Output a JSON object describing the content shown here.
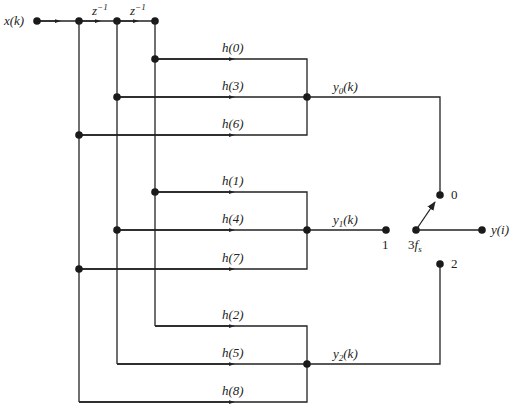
{
  "diagram": {
    "type": "polyphase FIR filter with commutator switch",
    "input_label": "x(k)",
    "delays": [
      "z^-1",
      "z^-1"
    ],
    "delay_symbol": "z",
    "delay_exponent": "−1",
    "coefficients": {
      "branch0": [
        "h(0)",
        "h(3)",
        "h(6)"
      ],
      "branch1": [
        "h(1)",
        "h(4)",
        "h(7)"
      ],
      "branch2": [
        "h(2)",
        "h(5)",
        "h(8)"
      ]
    },
    "branch_outputs": [
      {
        "var": "y",
        "sub": "0",
        "arg": "(k)"
      },
      {
        "var": "y",
        "sub": "1",
        "arg": "(k)"
      },
      {
        "var": "y",
        "sub": "2",
        "arg": "(k)"
      }
    ],
    "switch": {
      "positions": [
        "0",
        "1",
        "2"
      ],
      "rate_coef": "3",
      "rate_var": "f",
      "rate_sub": "s",
      "selected_position": "0"
    },
    "output_label": "y(i)",
    "colors": {
      "line": "#222222",
      "background": "#ffffff"
    }
  }
}
